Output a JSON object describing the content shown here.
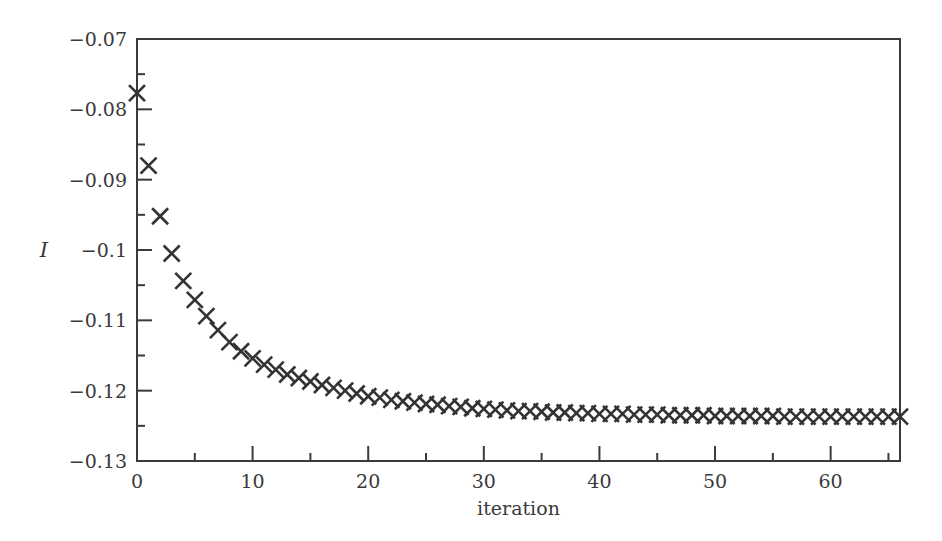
{
  "chart_data": {
    "type": "scatter",
    "title": "",
    "xlabel": "iteration",
    "ylabel": "I",
    "xlim": [
      0,
      66
    ],
    "ylim": [
      -0.13,
      -0.07
    ],
    "grid": false,
    "legend": null,
    "marker": "x",
    "marker_color": "#333333",
    "x_ticks": [
      0,
      10,
      20,
      30,
      40,
      50,
      60
    ],
    "x_tick_labels": [
      "0",
      "10",
      "20",
      "30",
      "40",
      "50",
      "60"
    ],
    "x_minor_ticks": [
      5,
      15,
      25,
      35,
      45,
      55,
      65
    ],
    "y_ticks": [
      -0.07,
      -0.08,
      -0.09,
      -0.1,
      -0.11,
      -0.12,
      -0.13
    ],
    "y_tick_labels": [
      "−0.07",
      "−0.08",
      "−0.09",
      "−0.1",
      "−0.11",
      "−0.12",
      "−0.13"
    ],
    "y_minor_ticks": [
      -0.075,
      -0.085,
      -0.095,
      -0.105,
      -0.115,
      -0.125
    ],
    "series": [
      {
        "name": "I",
        "x": [
          0,
          1,
          2,
          3,
          4,
          5,
          6,
          7,
          8,
          9,
          10,
          11,
          12,
          13,
          14,
          15,
          16,
          17,
          18,
          19,
          20,
          21,
          22,
          23,
          24,
          25,
          26,
          27,
          28,
          29,
          30,
          31,
          32,
          33,
          34,
          35,
          36,
          37,
          38,
          39,
          40,
          41,
          42,
          43,
          44,
          45,
          46,
          47,
          48,
          49,
          50,
          51,
          52,
          53,
          54,
          55,
          56,
          57,
          58,
          59,
          60,
          61,
          62,
          63,
          64,
          65,
          66
        ],
        "values": [
          -0.0777,
          -0.088,
          -0.0952,
          -0.1005,
          -0.1044,
          -0.1071,
          -0.1094,
          -0.1114,
          -0.1131,
          -0.1144,
          -0.1154,
          -0.1163,
          -0.117,
          -0.1177,
          -0.1182,
          -0.1187,
          -0.1192,
          -0.1196,
          -0.12,
          -0.1204,
          -0.1208,
          -0.121,
          -0.1213,
          -0.1215,
          -0.1217,
          -0.1219,
          -0.122,
          -0.1222,
          -0.1223,
          -0.1225,
          -0.1226,
          -0.1227,
          -0.1228,
          -0.1229,
          -0.1229,
          -0.123,
          -0.1231,
          -0.1231,
          -0.1232,
          -0.1232,
          -0.1233,
          -0.1233,
          -0.1233,
          -0.1234,
          -0.1234,
          -0.1234,
          -0.1235,
          -0.1235,
          -0.1235,
          -0.1235,
          -0.1236,
          -0.1236,
          -0.1236,
          -0.1236,
          -0.1236,
          -0.1236,
          -0.1237,
          -0.1237,
          -0.1237,
          -0.1237,
          -0.1237,
          -0.1237,
          -0.1237,
          -0.1237,
          -0.1237,
          -0.1237,
          -0.1237
        ]
      }
    ]
  },
  "plot_area": {
    "left": 137,
    "right": 900,
    "top": 39,
    "bottom": 461
  },
  "frame_color": "#3a3a3a"
}
